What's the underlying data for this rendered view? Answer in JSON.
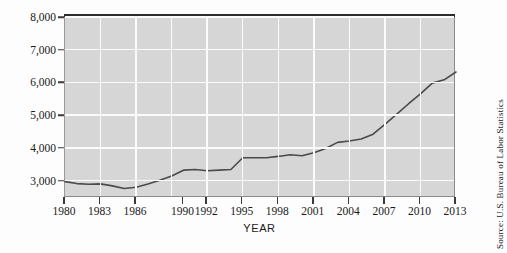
{
  "figure": {
    "xaxis_title": "YEAR",
    "source_note": "Source: U.S. Bureau of Labor Statistics"
  },
  "chart_data": {
    "type": "line",
    "title": "",
    "xlabel": "YEAR",
    "ylabel": "",
    "xlim": [
      1980,
      2013
    ],
    "ylim": [
      2500,
      8000
    ],
    "grid": true,
    "legend": "none",
    "y_tick_labels": [
      "3,000",
      "4,000",
      "5,000",
      "6,000",
      "7,000",
      "8,000"
    ],
    "y_ticks": [
      3000,
      4000,
      5000,
      6000,
      7000,
      8000
    ],
    "x_tick_labels": [
      "1980",
      "1983",
      "1986",
      "1990",
      "1992",
      "1995",
      "1998",
      "2001",
      "2004",
      "2007",
      "2010",
      "2013"
    ],
    "x_ticks": [
      1980,
      1983,
      1986,
      1990,
      1992,
      1995,
      1998,
      2001,
      2004,
      2007,
      2010,
      2013
    ],
    "x": [
      1980,
      1981,
      1982,
      1983,
      1984,
      1985,
      1986,
      1987,
      1988,
      1989,
      1990,
      1991,
      1992,
      1993,
      1994,
      1995,
      1996,
      1997,
      1998,
      1999,
      2000,
      2001,
      2002,
      2003,
      2004,
      2005,
      2006,
      2007,
      2008,
      2009,
      2010,
      2011,
      2012,
      2013
    ],
    "values": [
      2970,
      2910,
      2890,
      2900,
      2840,
      2760,
      2800,
      2900,
      3010,
      3140,
      3320,
      3340,
      3300,
      3320,
      3340,
      3700,
      3700,
      3700,
      3740,
      3790,
      3760,
      3850,
      3980,
      4170,
      4210,
      4270,
      4420,
      4720,
      5030,
      5350,
      5650,
      5980,
      6080,
      6320
    ],
    "series": [
      {
        "name": "value",
        "color": "#4a4a4a",
        "values": [
          2970,
          2910,
          2890,
          2900,
          2840,
          2760,
          2800,
          2900,
          3010,
          3140,
          3320,
          3340,
          3300,
          3320,
          3340,
          3700,
          3700,
          3700,
          3740,
          3790,
          3760,
          3850,
          3980,
          4170,
          4210,
          4270,
          4420,
          4720,
          5030,
          5350,
          5650,
          5980,
          6080,
          6320
        ]
      }
    ],
    "colors": {
      "line": "#4a4a4a",
      "plot_background": "#d6d6d6",
      "gridline": "#fbfbfb",
      "axis": "#3a3a3a"
    }
  }
}
